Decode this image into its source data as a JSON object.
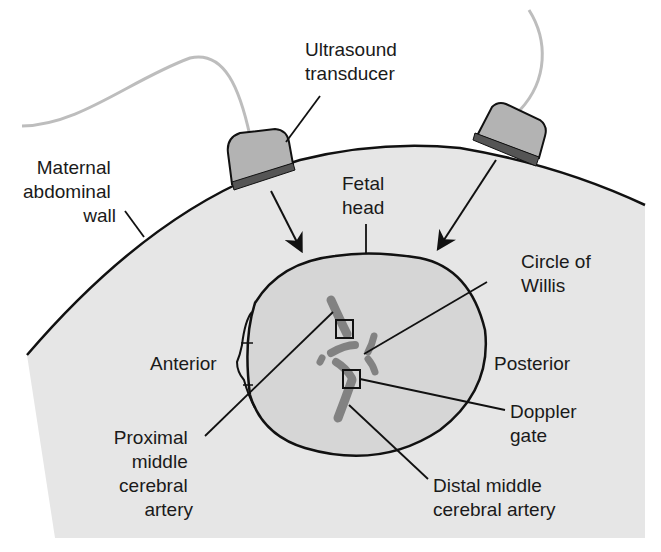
{
  "figure": {
    "colors": {
      "background": "#ffffff",
      "abdomen_fill": "#e6e6e6",
      "fetal_head_fill": "#d6d6d6",
      "outline": "#111111",
      "transducer_body": "#b3b3b3",
      "transducer_face": "#555555",
      "cable": "#bdbdbd",
      "vessel": "#7a7a7a"
    },
    "labels": {
      "transducer_line1": "Ultrasound",
      "transducer_line2": "transducer",
      "maternal_line1": "Maternal",
      "maternal_line2": "abdominal",
      "maternal_line3": "wall",
      "fetal_head_line1": "Fetal",
      "fetal_head_line2": "head",
      "circle_willis_line1": "Circle of",
      "circle_willis_line2": "Willis",
      "anterior": "Anterior",
      "posterior": "Posterior",
      "doppler_line1": "Doppler",
      "doppler_line2": "gate",
      "proximal_line1": "Proximal",
      "proximal_line2": "middle",
      "proximal_line3": "cerebral",
      "proximal_line4": "artery",
      "distal_line1": "Distal middle",
      "distal_line2": "cerebral artery"
    }
  }
}
